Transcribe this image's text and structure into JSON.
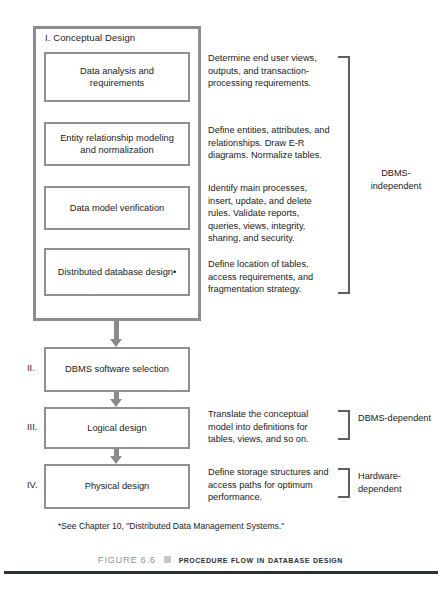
{
  "figure": {
    "phase1": {
      "title": "I. Conceptual Design",
      "steps": [
        {
          "label": "Data analysis and requirements"
        },
        {
          "label": "Entity relationship modeling and normalization"
        },
        {
          "label": "Data model verification"
        },
        {
          "label": "Distributed database design•"
        }
      ]
    },
    "stages": [
      {
        "numeral": "II.",
        "label": "DBMS software selection"
      },
      {
        "numeral": "III.",
        "label": "Logical design"
      },
      {
        "numeral": "IV.",
        "label": "Physical design"
      }
    ],
    "descriptions": [
      "Determine end user views, outputs, and transaction-processing requirements.",
      "Define entities, attributes, and relationships. Draw E-R diagrams. Normalize tables.",
      "Identify main processes, insert, update, and delete rules. Validate reports, queries, views, integrity, sharing, and security.",
      "Define location of tables, access requirements, and fragmentation strategy.",
      "Translate the conceptual model into definitions for tables, views, and so on.",
      "Define storage structures and access paths for optimum performance."
    ],
    "bracket_labels": [
      "DBMS-independent",
      "DBMS-dependent",
      "Hardware-dependent"
    ],
    "footnote": "*See Chapter 10, \"Distributed Data Management Systems.\"",
    "caption": {
      "figure_number": "FIGURE 6.6",
      "title": "Procedure Flow in Database Design"
    },
    "colors": {
      "box_border": "#909090",
      "outer_border": "#8d8d8d",
      "arrow": "#8a8a8a",
      "bracket": "#5e5e5e",
      "caption_figure": "#8f9398",
      "caption_bullet": "#c3c7cb",
      "caption_title": "#2d3136",
      "rule": "#2d3136",
      "text": "#1a1a1a"
    }
  }
}
